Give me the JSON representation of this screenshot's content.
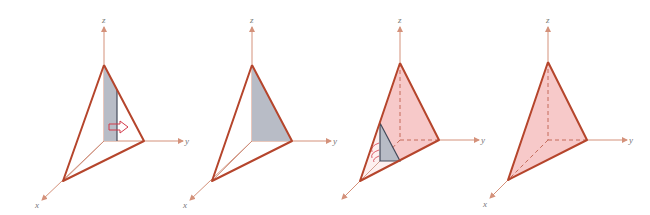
{
  "figure": {
    "panels": [
      {
        "id": "panel-1",
        "description": "tetrahedron with vertical slice strip shaded and arrow pointing in +y direction",
        "axes": {
          "x": "x",
          "y": "y",
          "z": "z"
        }
      },
      {
        "id": "panel-2",
        "description": "tetrahedron with yz-face triangle shaded",
        "axes": {
          "x": "x",
          "y": "y",
          "z": "z"
        }
      },
      {
        "id": "panel-3",
        "description": "solid tetrahedron shaded pink with triangular cross-section slice and curved arrow",
        "axes": {
          "x": "x",
          "y": "y",
          "z": "z"
        }
      },
      {
        "id": "panel-4",
        "description": "solid tetrahedron shaded pink with hidden dashed edges",
        "axes": {
          "x": "x",
          "y": "y",
          "z": "z"
        }
      }
    ],
    "colors": {
      "edge": "#b5452c",
      "axis": "#d4917a",
      "slice_fill": "#b8bcc6",
      "solid_fill": "#f7c9c9"
    }
  }
}
